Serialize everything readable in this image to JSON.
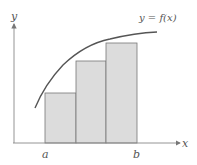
{
  "diagram": {
    "type": "riemann-sum",
    "curve_label": "y = f(x)",
    "x_axis_label": "x",
    "y_axis_label": "y",
    "interval_start_label": "a",
    "interval_end_label": "b",
    "rectangle_count": 3,
    "colors": {
      "bar_fill": "#dcdcdc",
      "bar_stroke": "#777777",
      "curve": "#555555",
      "axis": "#888888"
    }
  }
}
